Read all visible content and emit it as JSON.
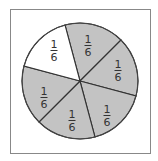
{
  "figure": {
    "title": "",
    "frame": {
      "x": 10,
      "y": 9,
      "width": 140,
      "height": 144,
      "stroke": "#888888"
    },
    "circle": {
      "cx": 80,
      "cy": 81,
      "r": 58,
      "stroke": "#444444"
    },
    "colors": {
      "shaded": "#c3c3c3",
      "unshaded": "#ffffff",
      "line": "#333333",
      "text": "#333333"
    },
    "sectors": [
      {
        "label_num": "1",
        "label_den": "6",
        "start_angle": -105,
        "end_angle": -45,
        "shaded": true,
        "label_pos": [
          88,
          45
        ]
      },
      {
        "label_num": "1",
        "label_den": "6",
        "start_angle": -45,
        "end_angle": 15,
        "shaded": true,
        "label_pos": [
          118,
          70
        ]
      },
      {
        "label_num": "1",
        "label_den": "6",
        "start_angle": 15,
        "end_angle": 75,
        "shaded": true,
        "label_pos": [
          107,
          115
        ]
      },
      {
        "label_num": "1",
        "label_den": "6",
        "start_angle": 75,
        "end_angle": 135,
        "shaded": true,
        "label_pos": [
          72,
          120
        ]
      },
      {
        "label_num": "1",
        "label_den": "6",
        "start_angle": 135,
        "end_angle": 195,
        "shaded": true,
        "label_pos": [
          44,
          97
        ]
      },
      {
        "label_num": "1",
        "label_den": "6",
        "start_angle": 195,
        "end_angle": 255,
        "shaded": false,
        "label_pos": [
          54,
          50
        ]
      }
    ]
  }
}
